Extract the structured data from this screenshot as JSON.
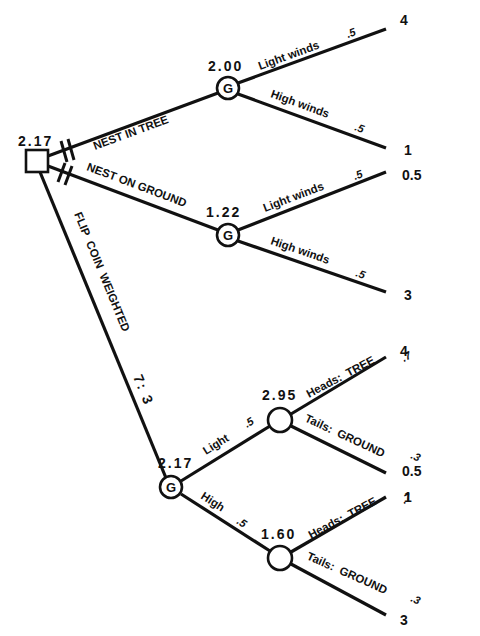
{
  "diagram": {
    "type": "decision-tree",
    "root": {
      "kind": "decision",
      "value": "2.17",
      "options": [
        {
          "label": "NEST IN TREE",
          "pruned": true,
          "node": {
            "kind": "chance",
            "symbol": "G",
            "value": "2.00",
            "branches": [
              {
                "label": "Light winds",
                "prob": ".5",
                "payoff": "4"
              },
              {
                "label": "High winds",
                "prob": ".5",
                "payoff": "1"
              }
            ]
          }
        },
        {
          "label": "NEST ON GROUND",
          "pruned": true,
          "node": {
            "kind": "chance",
            "symbol": "G",
            "value": "1.22",
            "branches": [
              {
                "label": "Light winds",
                "prob": ".5",
                "payoff": "0.5"
              },
              {
                "label": "High winds",
                "prob": ".5",
                "payoff": "3"
              }
            ]
          }
        },
        {
          "label": "FLIP  COIN  WEIGHTED",
          "ratio": "7: 3",
          "pruned": false,
          "node": {
            "kind": "chance",
            "symbol": "G",
            "value": "2.17",
            "branches": [
              {
                "label": "Light",
                "prob": ".5",
                "node": {
                  "kind": "chance",
                  "value": "2.95",
                  "branches": [
                    {
                      "label": "Heads:  TREE",
                      "prob": ".7",
                      "payoff": "4"
                    },
                    {
                      "label": "Tails:  GROUND",
                      "prob": ".3",
                      "payoff": "0.5"
                    }
                  ]
                }
              },
              {
                "label": "High",
                "prob": ".5",
                "node": {
                  "kind": "chance",
                  "value": "1.60",
                  "branches": [
                    {
                      "label": "Heads:  TREE",
                      "prob": ".7",
                      "payoff": "1"
                    },
                    {
                      "label": "Tails:  GROUND",
                      "prob": ".3",
                      "payoff": "3"
                    }
                  ]
                }
              }
            ]
          }
        }
      ]
    }
  }
}
